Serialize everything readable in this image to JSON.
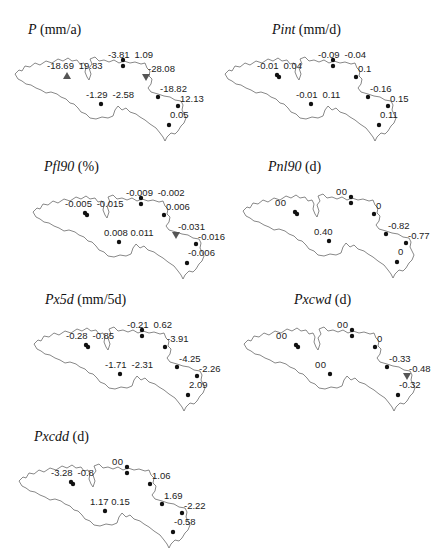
{
  "figure": {
    "marker_legend_semantics": {
      "dot": "trend not significant",
      "triangle-up": "significant increasing trend",
      "triangle-down": "significant decreasing trend"
    }
  },
  "panels": [
    {
      "id": "P",
      "var": "P",
      "unit": " (mm/a)",
      "stations": [
        {
          "labels": [
            "-18.69",
            "19.83"
          ],
          "marker": "triangle-up"
        },
        {
          "labels": [
            "-3.81",
            "1.09"
          ],
          "marker": "dot"
        },
        {
          "labels": [
            "-28.08"
          ],
          "marker": "triangle-down"
        },
        {
          "labels": [
            "-18.82"
          ],
          "marker": "dot"
        },
        {
          "labels": [
            "12.13"
          ],
          "marker": "dot"
        },
        {
          "labels": [
            "0.05"
          ],
          "marker": "dot"
        },
        {
          "labels": [
            "-1.29",
            "-2.58"
          ],
          "marker": "dot"
        }
      ]
    },
    {
      "id": "Pint",
      "var": "Pint",
      "unit": " (mm/d)",
      "stations": [
        {
          "labels": [
            "-0.01",
            "0.04"
          ],
          "marker": "dot"
        },
        {
          "labels": [
            "-0.09",
            "-0.04"
          ],
          "marker": "dot"
        },
        {
          "labels": [
            "0.1"
          ],
          "marker": "dot"
        },
        {
          "labels": [
            "-0.16"
          ],
          "marker": "dot"
        },
        {
          "labels": [
            "0.15"
          ],
          "marker": "dot"
        },
        {
          "labels": [
            "0.11"
          ],
          "marker": "dot"
        },
        {
          "labels": [
            "-0.01",
            "0.11"
          ],
          "marker": "dot"
        }
      ]
    },
    {
      "id": "Pfl90",
      "var": "Pfl90",
      "unit": " (%)",
      "stations": [
        {
          "labels": [
            "-0.005",
            "-0.015"
          ],
          "marker": "dot"
        },
        {
          "labels": [
            "-0.009",
            "-0.002"
          ],
          "marker": "dot"
        },
        {
          "labels": [
            "0.006"
          ],
          "marker": "dot"
        },
        {
          "labels": [
            "-0.031"
          ],
          "marker": "triangle-down"
        },
        {
          "labels": [
            "-0.016"
          ],
          "marker": "dot"
        },
        {
          "labels": [
            "-0.006"
          ],
          "marker": "dot"
        },
        {
          "labels": [
            "0.008",
            "0.011"
          ],
          "marker": "dot"
        }
      ]
    },
    {
      "id": "Pnl90",
      "var": "Pnl90",
      "unit": " (d)",
      "stations": [
        {
          "labels": [
            "0",
            "0"
          ],
          "marker": "dot"
        },
        {
          "labels": [
            "0",
            "0"
          ],
          "marker": "dot"
        },
        {
          "labels": [
            "0"
          ],
          "marker": "dot"
        },
        {
          "labels": [
            "-0.82"
          ],
          "marker": "dot"
        },
        {
          "labels": [
            "-0.77"
          ],
          "marker": "dot"
        },
        {
          "labels": [
            "0"
          ],
          "marker": "dot"
        },
        {
          "labels": [
            "0.40"
          ],
          "marker": "dot"
        }
      ]
    },
    {
      "id": "Px5d",
      "var": "Px5d",
      "unit": " (mm/5d)",
      "stations": [
        {
          "labels": [
            "-0.28",
            "-0.85"
          ],
          "marker": "dot"
        },
        {
          "labels": [
            "-0.21",
            "0.62"
          ],
          "marker": "dot"
        },
        {
          "labels": [
            "-3.91"
          ],
          "marker": "dot"
        },
        {
          "labels": [
            "-4.25"
          ],
          "marker": "dot"
        },
        {
          "labels": [
            "-2.26"
          ],
          "marker": "dot"
        },
        {
          "labels": [
            "2.09"
          ],
          "marker": "dot"
        },
        {
          "labels": [
            "-1.71",
            "-2.31"
          ],
          "marker": "dot"
        }
      ]
    },
    {
      "id": "Pxcwd",
      "var": "Pxcwd",
      "unit": " (d)",
      "stations": [
        {
          "labels": [
            "0",
            "0"
          ],
          "marker": "dot"
        },
        {
          "labels": [
            "0",
            "0"
          ],
          "marker": "dot"
        },
        {
          "labels": [
            "0"
          ],
          "marker": "dot"
        },
        {
          "labels": [
            "-0.33"
          ],
          "marker": "dot"
        },
        {
          "labels": [
            "-0.48"
          ],
          "marker": "triangle-down"
        },
        {
          "labels": [
            "-0.32"
          ],
          "marker": "dot"
        },
        {
          "labels": [
            "0",
            "0"
          ],
          "marker": "dot"
        }
      ]
    },
    {
      "id": "Pxcdd",
      "var": "Pxcdd",
      "unit": " (d)",
      "stations": [
        {
          "labels": [
            "-3.28",
            "-0.8"
          ],
          "marker": "dot"
        },
        {
          "labels": [
            "0",
            "0"
          ],
          "marker": "dot"
        },
        {
          "labels": [
            "1.06"
          ],
          "marker": "dot"
        },
        {
          "labels": [
            "1.69"
          ],
          "marker": "dot"
        },
        {
          "labels": [
            "-2.22"
          ],
          "marker": "dot"
        },
        {
          "labels": [
            "-0.58"
          ],
          "marker": "dot"
        },
        {
          "labels": [
            "1.17",
            "0.15"
          ],
          "marker": "dot"
        }
      ]
    }
  ]
}
